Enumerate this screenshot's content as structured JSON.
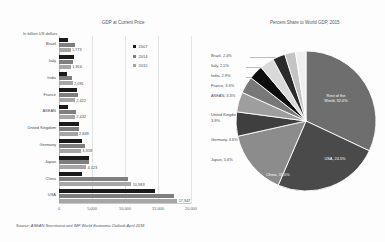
{
  "bar_chart": {
    "title": "GDP at Current Price",
    "unit_label": "In billion US dollars",
    "legend": [
      {
        "label": "2007",
        "color": "#1a1a1a"
      },
      {
        "label": "2014",
        "color": "#7f7f7f"
      },
      {
        "label": "2015",
        "color": "#a6a6a6"
      }
    ],
    "x_ticks": [
      "0",
      "5,000",
      "10,000",
      "15,000",
      "20,000"
    ],
    "source": "Source: ASEAN Secretariat and IMF World Economic Outlook April 2016"
  },
  "pie_chart": {
    "title": "Percent Share to World GDP, 2015"
  },
  "chart_data": [
    {
      "type": "bar",
      "title": "GDP at Current Price",
      "xlabel": "In billion US dollars",
      "ylabel": "",
      "xlim": [
        0,
        20000
      ],
      "grid": true,
      "legend_position": "top-right",
      "orientation": "horizontal",
      "categories": [
        "Brazil",
        "Italy",
        "India",
        "France",
        "ASEAN",
        "United Kingdom",
        "Germany",
        "Japan",
        "China",
        "USA"
      ],
      "series": [
        {
          "name": "2007",
          "color": "#1a1a1a",
          "values": [
            1397,
            2203,
            1239,
            2663,
            1389,
            3074,
            3440,
            4515,
            3552,
            14478
          ]
        },
        {
          "name": "2014",
          "color": "#7f7f7f",
          "values": [
            2417,
            2141,
            2035,
            2829,
            2509,
            3022,
            3879,
            4602,
            10430,
            17393
          ]
        },
        {
          "name": "2015",
          "color": "#a6a6a6",
          "values": [
            1773,
            1816,
            2091,
            2422,
            2432,
            2849,
            3358,
            4123,
            10983,
            17947
          ]
        }
      ],
      "value_labels": [
        "1,773",
        "1,816",
        "2,091",
        "2,422",
        "2,432",
        "2,849",
        "3,358",
        "4,123",
        "10,983",
        "17,947"
      ],
      "value_label_series": "2015"
    },
    {
      "type": "pie",
      "title": "Percent Share to World GDP, 2015",
      "labels": [
        "Rest of the World",
        "USA",
        "China",
        "Japan",
        "Germany",
        "United Kingdom",
        "ASEAN",
        "France",
        "India",
        "Italy",
        "Brazil"
      ],
      "values": [
        32.0,
        24.5,
        15.0,
        5.6,
        4.6,
        3.9,
        3.3,
        3.3,
        2.9,
        2.5,
        2.4
      ],
      "display_labels": [
        "Rest of the\nWorld, 32.0%",
        "USA, 24.5%",
        "China, 15.0%",
        "Japan, 5.6%",
        "Germany, 4.6%",
        "United Kingdom,\n3.9%",
        "ASEAN, 3.3%",
        "France, 3.3%",
        "India, 2.9%",
        "Italy, 2.5%",
        "Brazil, 2.4%"
      ],
      "colors": [
        "#6e6e6e",
        "#4a4a4a",
        "#8c8c8c",
        "#3f3f3f",
        "#9e9e9e",
        "#787878",
        "#0d0d0d",
        "#d9d9d9",
        "#2b2b2b",
        "#c4c4c4",
        "#ffffff"
      ],
      "legend_position": "callouts"
    }
  ],
  "pie_slices": [
    {
      "label": "Rest of the\nWorld, 32.0%",
      "value": 32.0,
      "color": "#6e6e6e"
    },
    {
      "label": "USA, 24.5%",
      "value": 24.5,
      "color": "#4a4a4a"
    },
    {
      "label": "China, 15.0%",
      "value": 15.0,
      "color": "#8c8c8c"
    },
    {
      "label": "Japan, 5.6%",
      "value": 5.6,
      "color": "#3f3f3f"
    },
    {
      "label": "Germany, 4.6%",
      "value": 4.6,
      "color": "#9e9e9e"
    },
    {
      "label": "United Kingdom,\n3.9%",
      "value": 3.9,
      "color": "#787878"
    },
    {
      "label": "ASEAN, 3.3%",
      "value": 3.3,
      "color": "#0d0d0d"
    },
    {
      "label": "France, 3.3%",
      "value": 3.3,
      "color": "#d9d9d9"
    },
    {
      "label": "India, 2.9%",
      "value": 2.9,
      "color": "#2b2b2b"
    },
    {
      "label": "Italy, 2.5%",
      "value": 2.5,
      "color": "#c4c4c4"
    },
    {
      "label": "Brazil, 2.4%",
      "value": 2.4,
      "color": "#efefef"
    }
  ],
  "pie_callouts": [
    {
      "text": "Brazil, 2.4%",
      "x": 0,
      "y": 55
    },
    {
      "text": "Italy, 2.5%",
      "x": 0,
      "y": 65
    },
    {
      "text": "India, 2.9%",
      "x": 0,
      "y": 75
    },
    {
      "text": "France, 3.3%",
      "x": 0,
      "y": 85
    },
    {
      "text": "ASEAN, 3.3%",
      "x": 0,
      "y": 95
    },
    {
      "text": "United Kingdom,",
      "x": 0,
      "y": 116
    },
    {
      "text": "3.9%",
      "x": 0,
      "y": 122
    },
    {
      "text": "Germany, 4.6%",
      "x": 0,
      "y": 140
    },
    {
      "text": "Japan, 5.6%",
      "x": 0,
      "y": 160
    }
  ]
}
